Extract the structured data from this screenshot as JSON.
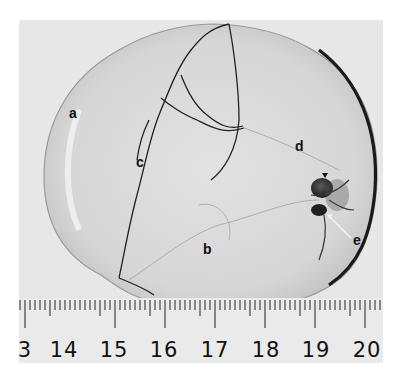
{
  "figure": {
    "labels": [
      {
        "id": "a",
        "text": "a",
        "x": 69,
        "y": 108
      },
      {
        "id": "b",
        "text": "b",
        "x": 203,
        "y": 244
      },
      {
        "id": "c",
        "text": "c",
        "x": 136,
        "y": 157
      },
      {
        "id": "d",
        "text": "d",
        "x": 297,
        "y": 141
      },
      {
        "id": "e",
        "text": "e",
        "x": 353,
        "y": 235
      }
    ],
    "colors": {
      "background": "#e7e7e7",
      "specimen_fill": "#dcdcdc",
      "outline": "#1a1a1a",
      "dark_mass": "#2a2a2a"
    }
  },
  "ruler": {
    "unit": "cm",
    "tick_labels": [
      "3",
      "14",
      "15",
      "16",
      "17",
      "18",
      "19",
      "20"
    ],
    "tick_positions_px": [
      6,
      45,
      95,
      145,
      196,
      247,
      297,
      348
    ],
    "px_per_cm": 50.5,
    "minor_ticks_per_cm": 10
  }
}
